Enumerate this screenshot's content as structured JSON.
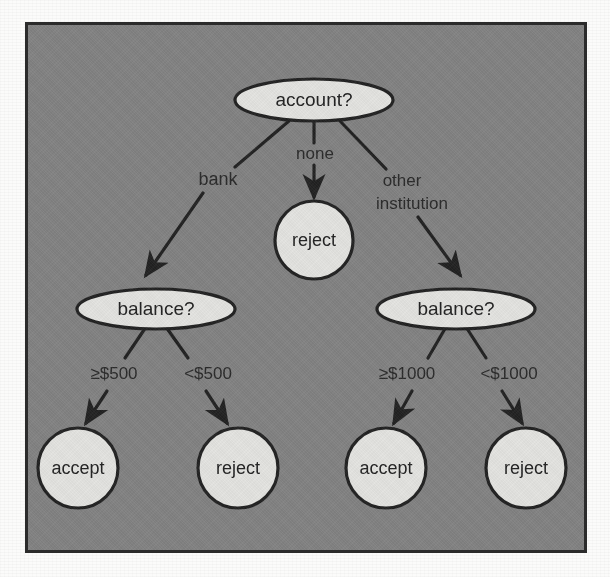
{
  "figure": {
    "panel_bg_color": "#828282",
    "panel_border_color": "#2b2b2b",
    "node_fill_color": "#e3e3e0",
    "node_stroke_color": "#242424",
    "edge_color": "#232323",
    "text_color": "#232323"
  },
  "tree": {
    "root": {
      "id": "account",
      "shape": "ellipse",
      "label": "account?"
    },
    "decision_nodes": [
      {
        "id": "balance-left",
        "shape": "ellipse",
        "label": "balance?"
      },
      {
        "id": "balance-right",
        "shape": "ellipse",
        "label": "balance?"
      }
    ],
    "leaf_nodes": [
      {
        "id": "reject-none",
        "shape": "circle",
        "label": "reject"
      },
      {
        "id": "accept-left",
        "shape": "circle",
        "label": "accept"
      },
      {
        "id": "reject-left",
        "shape": "circle",
        "label": "reject"
      },
      {
        "id": "accept-right",
        "shape": "circle",
        "label": "accept"
      },
      {
        "id": "reject-right",
        "shape": "circle",
        "label": "reject"
      }
    ],
    "edges": [
      {
        "id": "edge-bank",
        "from": "account",
        "to": "balance-left",
        "label": "bank"
      },
      {
        "id": "edge-none",
        "from": "account",
        "to": "reject-none",
        "label": "none"
      },
      {
        "id": "edge-other-institution",
        "from": "account",
        "to": "balance-right",
        "label_line1": "other",
        "label_line2": "institution"
      },
      {
        "id": "edge-ge-500",
        "from": "balance-left",
        "to": "accept-left",
        "label": "≥$500"
      },
      {
        "id": "edge-lt-500",
        "from": "balance-left",
        "to": "reject-left",
        "label": "<$500"
      },
      {
        "id": "edge-ge-1000",
        "from": "balance-right",
        "to": "accept-right",
        "label": "≥$1000"
      },
      {
        "id": "edge-lt-1000",
        "from": "balance-right",
        "to": "reject-right",
        "label": "<$1000"
      }
    ]
  }
}
